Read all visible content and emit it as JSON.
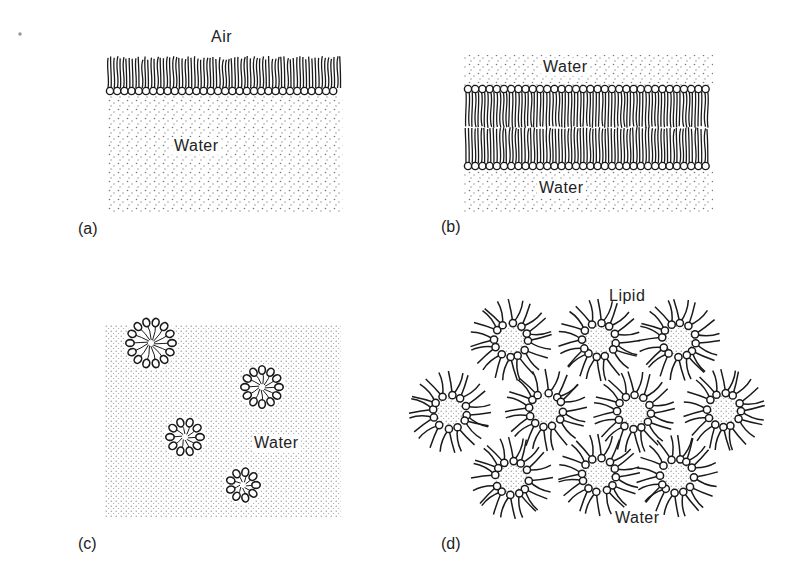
{
  "figure": {
    "panels": [
      {
        "id": "a",
        "label": "(a)",
        "title": "Lipid monolayer at air-water interface",
        "texts": {
          "top": "Air",
          "bottom": "Water"
        }
      },
      {
        "id": "b",
        "label": "(b)",
        "title": "Lipid bilayer",
        "texts": {
          "top": "Water",
          "bottom": "Water"
        }
      },
      {
        "id": "c",
        "label": "(c)",
        "title": "Micelles in water",
        "texts": {
          "medium": "Water"
        },
        "micelles": [
          {
            "cx": 151,
            "cy": 343,
            "r": 25
          },
          {
            "cx": 262,
            "cy": 387,
            "r": 21
          },
          {
            "cx": 185,
            "cy": 437,
            "r": 19
          },
          {
            "cx": 243,
            "cy": 485,
            "r": 17
          }
        ]
      },
      {
        "id": "d",
        "label": "(d)",
        "title": "Reverse micelles in lipid",
        "texts": {
          "top": "Lipid",
          "bottom": "Water"
        },
        "reverse_micelles": [
          {
            "cx": 511,
            "cy": 340
          },
          {
            "cx": 599,
            "cy": 340
          },
          {
            "cx": 679,
            "cy": 340
          },
          {
            "cx": 450,
            "cy": 412
          },
          {
            "cx": 546,
            "cy": 410
          },
          {
            "cx": 634,
            "cy": 412
          },
          {
            "cx": 724,
            "cy": 410
          },
          {
            "cx": 512,
            "cy": 478
          },
          {
            "cx": 599,
            "cy": 475
          },
          {
            "cx": 677,
            "cy": 476
          }
        ]
      }
    ],
    "colors": {
      "ink": "#1a1a1a",
      "stipple": "#777777",
      "background": "#ffffff"
    }
  }
}
